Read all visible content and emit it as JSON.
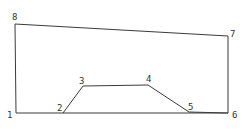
{
  "diagram": {
    "stroke_color": "#3a3a3a",
    "label_color": "#333333",
    "background": "#ffffff",
    "nodes": [
      {
        "id": "1",
        "label": "1",
        "x": 16,
        "y": 113,
        "lx": 7,
        "ly": 118
      },
      {
        "id": "2",
        "label": "2",
        "x": 63,
        "y": 113,
        "lx": 57,
        "ly": 111
      },
      {
        "id": "3",
        "label": "3",
        "x": 83,
        "y": 86,
        "lx": 79,
        "ly": 84
      },
      {
        "id": "4",
        "label": "4",
        "x": 148,
        "y": 85,
        "lx": 146,
        "ly": 82
      },
      {
        "id": "5",
        "label": "5",
        "x": 189,
        "y": 112,
        "lx": 188,
        "ly": 110
      },
      {
        "id": "6",
        "label": "6",
        "x": 228,
        "y": 113,
        "lx": 232,
        "ly": 118
      },
      {
        "id": "7",
        "label": "7",
        "x": 228,
        "y": 36,
        "lx": 230,
        "ly": 37
      },
      {
        "id": "8",
        "label": "8",
        "x": 15,
        "y": 24,
        "lx": 12,
        "ly": 20
      }
    ],
    "edges": [
      [
        "1",
        "6"
      ],
      [
        "2",
        "3"
      ],
      [
        "3",
        "4"
      ],
      [
        "4",
        "5"
      ],
      [
        "5",
        "6"
      ],
      [
        "6",
        "7"
      ],
      [
        "7",
        "8"
      ],
      [
        "8",
        "1"
      ]
    ]
  }
}
